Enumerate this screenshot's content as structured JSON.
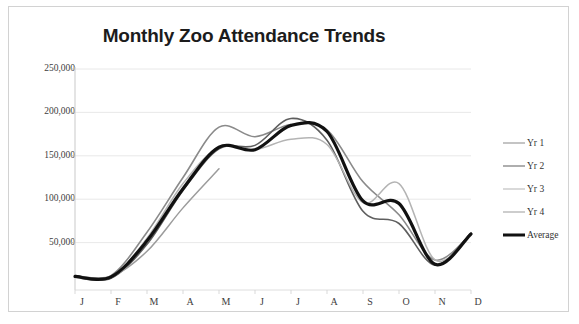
{
  "frame": {
    "border_color": "#d2d2d2",
    "background": "#ffffff"
  },
  "chart_data": {
    "type": "line",
    "title": "Monthly Zoo Attendance Trends",
    "xlabel": "",
    "ylabel": "",
    "categories": [
      "J",
      "F",
      "M",
      "A",
      "M",
      "J",
      "J",
      "A",
      "S",
      "O",
      "N",
      "D"
    ],
    "category_names": [
      "January",
      "February",
      "March",
      "April",
      "May",
      "June",
      "July",
      "August",
      "September",
      "October",
      "November",
      "December"
    ],
    "ylim": [
      0,
      250000
    ],
    "yticks": [
      50000,
      100000,
      150000,
      200000,
      250000
    ],
    "ytick_labels": [
      "50,000",
      "100,000",
      "150,000",
      "200,000",
      "250,000"
    ],
    "grid": true,
    "legend_position": "right",
    "series": [
      {
        "name": "Yr 1",
        "color": "#8a8a8a",
        "width": 1.6,
        "values": [
          11000,
          12000,
          62000,
          125000,
          183000,
          172000,
          186000,
          180000,
          120000,
          82000,
          30000,
          60000
        ]
      },
      {
        "name": "Yr 2",
        "color": "#5e5e5e",
        "width": 1.6,
        "values": [
          10000,
          9000,
          48000,
          110000,
          158000,
          162000,
          193000,
          168000,
          86000,
          72000,
          24000,
          61000
        ]
      },
      {
        "name": "Yr 3",
        "color": "#b4b4b4",
        "width": 1.5,
        "values": [
          11000,
          10000,
          55000,
          118000,
          160000,
          157000,
          169000,
          163000,
          96000,
          118000,
          30000,
          60000
        ]
      },
      {
        "name": "Yr 4",
        "color": "#9c9c9c",
        "width": 1.5,
        "values": [
          12000,
          11000,
          40000,
          90000,
          135000,
          null,
          null,
          null,
          null,
          null,
          null,
          null
        ]
      },
      {
        "name": "Average",
        "color": "#111111",
        "width": 3.2,
        "values": [
          11000,
          10500,
          52000,
          112000,
          160000,
          157000,
          185000,
          178000,
          98000,
          95000,
          25000,
          60000
        ]
      }
    ]
  }
}
